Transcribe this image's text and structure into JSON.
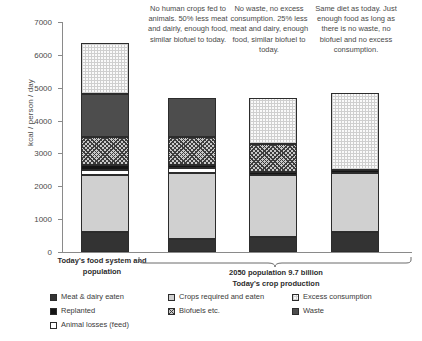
{
  "chart_data": {
    "type": "bar",
    "subtype": "stacked-bar",
    "title": "",
    "xlabel": "",
    "ylabel": "kcal / person / day",
    "ylim": [
      0,
      7000
    ],
    "ytick_step": 1000,
    "yticks": [
      "0",
      "1000",
      "2000",
      "3000",
      "4000",
      "5000",
      "6000",
      "7000"
    ],
    "grid": false,
    "legend_position": "bottom",
    "categories": [
      "Today's food system and population",
      "No human crops fed to animals. 50% less meat and dairly, enough food, similar biofuel to today.",
      "No waste, no excess consumption. 25% less meat and dairy, enough food, similar biofuel to today.",
      "Same diet as today. Just enough food as long as there is no waste, no biofuel and no excess consumption."
    ],
    "series": [
      {
        "name": "Meat & dairy eaten",
        "key": "meat",
        "values": [
          600,
          400,
          450,
          600
        ]
      },
      {
        "name": "Crops required and eaten",
        "key": "crops",
        "values": [
          1750,
          2000,
          1900,
          1800
        ]
      },
      {
        "name": "Animal losses (feed)",
        "key": "losses",
        "values": [
          150,
          150,
          0,
          0
        ]
      },
      {
        "name": "Replanted",
        "key": "replant",
        "values": [
          150,
          100,
          100,
          100
        ]
      },
      {
        "name": "Biofuels etc.",
        "key": "biofuel",
        "values": [
          850,
          850,
          850,
          0
        ]
      },
      {
        "name": "Waste",
        "key": "waste",
        "values": [
          1300,
          1200,
          0,
          0
        ]
      },
      {
        "name": "Excess consumption",
        "key": "excess",
        "values": [
          1550,
          0,
          1400,
          2350
        ]
      }
    ],
    "bar_totals": [
      6350,
      4700,
      4700,
      4850
    ]
  },
  "axis": {
    "y_title": "kcal / person / day"
  },
  "scenarios": [
    {
      "caption": ""
    },
    {
      "caption": "No human crops fed to animals. 50% less meat and dairly, enough food, similar biofuel to today."
    },
    {
      "caption": "No waste, no excess consumption. 25% less meat and dairy, enough food, similar biofuel to today."
    },
    {
      "caption": "Same diet as today. Just enough food as long as there is no waste, no biofuel and no excess consumption."
    }
  ],
  "category_labels": {
    "first": "Today's food system and population",
    "group_line1": "2050 population 9.7 billion",
    "group_line2": "Today's crop production"
  },
  "legend": {
    "items": [
      {
        "label": "Meat & dairy eaten",
        "key": "meat",
        "color": "#333333"
      },
      {
        "label": "Crops required and eaten",
        "key": "crops",
        "color": "#d0d0d0"
      },
      {
        "label": "Excess consumption",
        "key": "excess",
        "color": "#fafafa"
      },
      {
        "label": "Replanted",
        "key": "replant",
        "color": "#151515"
      },
      {
        "label": "Biofuels etc.",
        "key": "biofuel",
        "color": "#c9c9c9"
      },
      {
        "label": "Waste",
        "key": "waste",
        "color": "#4d4d4d"
      },
      {
        "label": "Animal losses (feed)",
        "key": "losses",
        "color": "#ffffff"
      }
    ]
  }
}
